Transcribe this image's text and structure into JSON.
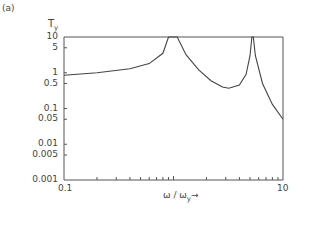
{
  "figure": {
    "panel_label": "(a)",
    "y_title_main": "T",
    "y_title_sub": "y",
    "x_title_main": "ω / ω",
    "x_title_sub": "y",
    "x_arrow": "→"
  },
  "chart_data": {
    "type": "line",
    "title": "",
    "panel": "(a)",
    "xlabel": "ω/ω_y",
    "ylabel": "T_y",
    "xscale": "log",
    "yscale": "log",
    "xlim": [
      0.1,
      10
    ],
    "ylim": [
      0.001,
      10
    ],
    "grid": false,
    "legend": null,
    "x_tick_labels": [
      "0.1",
      "10"
    ],
    "y_tick_labels": [
      "10",
      "5",
      "1",
      "0.5",
      "0.1",
      "0.05",
      "0.01",
      "0.005",
      "0.001"
    ],
    "series": [
      {
        "name": "T_y",
        "x": [
          0.1,
          0.2,
          0.4,
          0.6,
          0.8,
          0.9,
          1.08,
          1.3,
          1.7,
          2.2,
          2.8,
          3.2,
          4.0,
          4.6,
          5.0,
          5.2,
          5.35,
          5.6,
          6.5,
          8.0,
          10.0
        ],
        "y": [
          0.85,
          1.0,
          1.3,
          1.8,
          3.5,
          10,
          10,
          3.2,
          1.2,
          0.6,
          0.4,
          0.37,
          0.45,
          0.9,
          3.0,
          10,
          10,
          3.0,
          0.5,
          0.13,
          0.05
        ]
      }
    ]
  },
  "axes_px": {
    "x0": 64,
    "x1": 283,
    "y0": 37,
    "y1": 180
  }
}
